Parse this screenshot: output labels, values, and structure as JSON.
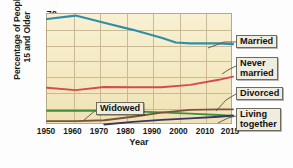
{
  "chart_data": {
    "type": "line",
    "title": "",
    "xlabel": "Year",
    "ylabel": "Percentage of People 15 and Older",
    "x": [
      1950,
      1960,
      1970,
      1980,
      1990,
      2000,
      2010,
      2015
    ],
    "xlim": [
      1950,
      2015
    ],
    "ylim": [
      0,
      70
    ],
    "yticks": [
      10,
      20,
      30,
      40,
      50,
      60,
      70
    ],
    "xticks": [
      "1950",
      "1960",
      "1970",
      "1980",
      "1990",
      "2000",
      "2010",
      "2015"
    ],
    "grid": true,
    "legend": "annotated-callouts",
    "series": [
      {
        "name": "Married",
        "color": "#2f8ea9",
        "x": [
          1950,
          1960,
          1970,
          1980,
          1990,
          1995,
          2000,
          2010,
          2015
        ],
        "values": [
          66.8,
          69.0,
          64.5,
          60.0,
          55.0,
          52.0,
          51.5,
          51.5,
          51.0
        ]
      },
      {
        "name": "Never married",
        "color": "#d8494c",
        "x": [
          1950,
          1960,
          1970,
          1980,
          1990,
          2000,
          2010,
          2015
        ],
        "values": [
          23.5,
          22.0,
          24.0,
          23.8,
          23.8,
          25.3,
          28.5,
          30.5
        ]
      },
      {
        "name": "Widowed",
        "color": "#3f8f3a",
        "x": [
          1950,
          1960,
          1970,
          1980,
          1990,
          2000,
          2010,
          2015
        ],
        "values": [
          9.0,
          9.0,
          9.0,
          8.6,
          8.0,
          7.2,
          6.3,
          5.8
        ]
      },
      {
        "name": "Divorced",
        "color": "#7b5240",
        "x": [
          1950,
          1960,
          1970,
          1980,
          1990,
          2000,
          2010,
          2015
        ],
        "values": [
          2.4,
          2.5,
          3.0,
          5.2,
          7.8,
          9.5,
          9.8,
          9.9
        ]
      },
      {
        "name": "Living together",
        "color": "#3a3566",
        "x": [
          1970,
          1980,
          1990,
          2000,
          2010,
          2015
        ],
        "values": [
          0.3,
          2.0,
          3.2,
          4.2,
          5.2,
          6.0
        ]
      }
    ]
  },
  "axes": {
    "ylabel_line1": "Percentage of People",
    "ylabel_line2": "15 and Older",
    "xlabel": "Year",
    "yticks": [
      "70",
      "60",
      "50",
      "40",
      "30",
      "20",
      "10"
    ],
    "xticks": [
      "1950",
      "1960",
      "1970",
      "1980",
      "1990",
      "2000",
      "2010",
      "2015"
    ]
  },
  "callouts": {
    "married": "Married",
    "never_married_line1": "Never",
    "never_married_line2": "married",
    "divorced": "Divorced",
    "living_line1": "Living",
    "living_line2": "together",
    "widowed": "Widowed"
  },
  "colors": {
    "married": "#2f8ea9",
    "never_married": "#d8494c",
    "widowed": "#3f8f3a",
    "divorced": "#7b5240",
    "living_together": "#3a3566",
    "plot_bg": "#f6ecc9",
    "grid": "#c9b995",
    "axis_border": "#b9aa86",
    "callout_bg": "#efece0",
    "callout_border": "#6e6a5c"
  }
}
